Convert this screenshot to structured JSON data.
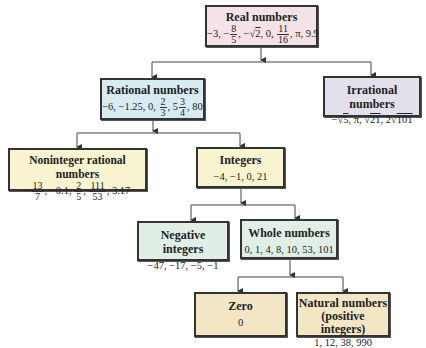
{
  "nodes": {
    "real": {
      "title": "Real numbers",
      "values": [
        "−3",
        "−8/5",
        "−√2",
        "0",
        "11/16",
        "π",
        "9.9"
      ],
      "parts": {
        "a": "−3, −",
        "f1n": "8",
        "f1d": "5",
        "b": ", −√",
        "r1": "2",
        "c": ", 0, ",
        "f2n": "11",
        "f2d": "16",
        "d": ", π, 9.9"
      }
    },
    "rational": {
      "title": "Rational numbers",
      "values": [
        "−6",
        "−1.25",
        "0",
        "2/3",
        "5 3/4",
        "80"
      ],
      "parts": {
        "a": "−6, −1.25, 0, ",
        "f1n": "2",
        "f1d": "3",
        "b": ", 5",
        "f2n": "3",
        "f2d": "4",
        "c": ", 80"
      }
    },
    "irrational": {
      "title": "Irrational numbers",
      "values": [
        "−√5",
        "π",
        "√21",
        "2√101"
      ],
      "parts": {
        "a": "−√",
        "r1": "5",
        "b": ", π, √",
        "r2": "21",
        "c": ", 2√",
        "r3": "101"
      }
    },
    "noninteger": {
      "title": "Noninteger rational numbers",
      "values": [
        "−13/7",
        "−0.1",
        "2/5",
        "111/53",
        "3.17"
      ],
      "parts": {
        "a": "−",
        "f1n": "13",
        "f1d": "7",
        "b": ", −0.1, ",
        "f2n": "2",
        "f2d": "5",
        "c": ", ",
        "f3n": "111",
        "f3d": "53",
        "d": ", 3.17"
      }
    },
    "integers": {
      "title": "Integers",
      "values_text": "−4, −1, 0, 21"
    },
    "negative": {
      "title": "Negative integers",
      "values_text": "−47, −17, −5, −1"
    },
    "whole": {
      "title": "Whole numbers",
      "values_text": "0, 1, 4, 8, 10, 53, 101"
    },
    "zero": {
      "title": "Zero",
      "values_text": "0"
    },
    "natural": {
      "title": "Natural numbers",
      "subtitle": "(positive integers)",
      "values_text": "1, 12, 38, 990"
    }
  },
  "colors": {
    "real": "#f4e2e6",
    "rational": "#d6ecf2",
    "irrational": "#e2e0ea",
    "noninteger": "#f8f4cf",
    "integers": "#f8f4cf",
    "negative": "#e0eee6",
    "whole": "#e0eee6",
    "zero": "#f3e6c4",
    "natural": "#f3e6c4"
  }
}
